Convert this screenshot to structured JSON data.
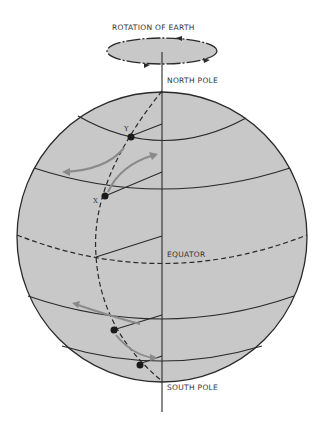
{
  "labels": {
    "rotation": "ROTATION OF EARTH",
    "north_pole": "NORTH POLE",
    "equator": "EQUATOR",
    "south_pole": "SOUTH POLE",
    "point_y": "Y",
    "point_x": "X"
  },
  "colors": {
    "sphere_fill": "#c8c8c8",
    "line": "#2a2a2a",
    "arrow": "#8a8a8a",
    "background": "#ffffff"
  }
}
